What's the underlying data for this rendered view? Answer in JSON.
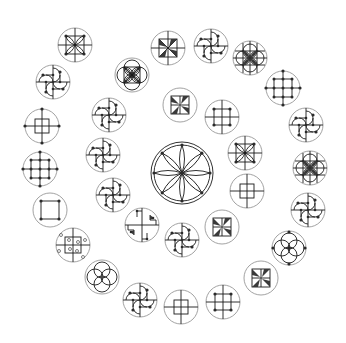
{
  "diagram": {
    "title": "",
    "background": "#ffffff",
    "colors": {
      "frame": "#8a8a8a",
      "ink": "#1a1a1a"
    },
    "center_motif": {
      "cx": 182,
      "cy": 173,
      "r": 31,
      "type": "eight-petal-rosette"
    },
    "motifs": [
      {
        "id": "m1",
        "cx": 75,
        "cy": 45,
        "r": 17,
        "type": "flower-square-cross"
      },
      {
        "id": "m2",
        "cx": 168,
        "cy": 48,
        "r": 17,
        "type": "pinwheel-square-cross"
      },
      {
        "id": "m3",
        "cx": 211,
        "cy": 46,
        "r": 17,
        "type": "arc-pinwheel"
      },
      {
        "id": "m4",
        "cx": 250,
        "cy": 58,
        "r": 17,
        "type": "flower-grid"
      },
      {
        "id": "m5",
        "cx": 132,
        "cy": 75,
        "r": 17,
        "type": "four-circle-square"
      },
      {
        "id": "m6",
        "cx": 53,
        "cy": 82,
        "r": 17,
        "type": "arc-pinwheel"
      },
      {
        "id": "m7",
        "cx": 283,
        "cy": 88,
        "r": 17,
        "type": "dot-grid-3x3"
      },
      {
        "id": "m8",
        "cx": 180,
        "cy": 105,
        "r": 17,
        "type": "small-pinwheel-square"
      },
      {
        "id": "m9",
        "cx": 109,
        "cy": 115,
        "r": 17,
        "type": "arc-pinwheel"
      },
      {
        "id": "m10",
        "cx": 222,
        "cy": 117,
        "r": 17,
        "type": "dot-square-cross"
      },
      {
        "id": "m11",
        "cx": 306,
        "cy": 125,
        "r": 17,
        "type": "arc-pinwheel"
      },
      {
        "id": "m12",
        "cx": 42,
        "cy": 126,
        "r": 17,
        "type": "square-cross-dots"
      },
      {
        "id": "m13",
        "cx": 245,
        "cy": 153,
        "r": 17,
        "type": "flower-square-cross"
      },
      {
        "id": "m14",
        "cx": 103,
        "cy": 155,
        "r": 17,
        "type": "arc-pinwheel"
      },
      {
        "id": "m15",
        "cx": 310,
        "cy": 168,
        "r": 17,
        "type": "flower-grid"
      },
      {
        "id": "m16",
        "cx": 40,
        "cy": 169,
        "r": 17,
        "type": "dot-grid-3x3"
      },
      {
        "id": "m17",
        "cx": 247,
        "cy": 191,
        "r": 17,
        "type": "square-cross"
      },
      {
        "id": "m18",
        "cx": 113,
        "cy": 195,
        "r": 17,
        "type": "arc-pinwheel"
      },
      {
        "id": "m19",
        "cx": 308,
        "cy": 210,
        "r": 17,
        "type": "arc-pinwheel"
      },
      {
        "id": "m20",
        "cx": 50,
        "cy": 210,
        "r": 17,
        "type": "square-corner-dots"
      },
      {
        "id": "m21",
        "cx": 142,
        "cy": 225,
        "r": 17,
        "type": "step-pinwheel"
      },
      {
        "id": "m22",
        "cx": 222,
        "cy": 227,
        "r": 17,
        "type": "small-pinwheel-square"
      },
      {
        "id": "m23",
        "cx": 182,
        "cy": 240,
        "r": 17,
        "type": "arc-pinwheel"
      },
      {
        "id": "m24",
        "cx": 73,
        "cy": 245,
        "r": 17,
        "type": "square-open-circles"
      },
      {
        "id": "m25",
        "cx": 289,
        "cy": 248,
        "r": 17,
        "type": "four-circle-dots"
      },
      {
        "id": "m26",
        "cx": 102,
        "cy": 277,
        "r": 17,
        "type": "four-circle"
      },
      {
        "id": "m27",
        "cx": 261,
        "cy": 278,
        "r": 17,
        "type": "small-pinwheel-square"
      },
      {
        "id": "m28",
        "cx": 140,
        "cy": 300,
        "r": 17,
        "type": "arc-pinwheel"
      },
      {
        "id": "m29",
        "cx": 223,
        "cy": 302,
        "r": 17,
        "type": "dot-square-cross"
      },
      {
        "id": "m30",
        "cx": 181,
        "cy": 307,
        "r": 17,
        "type": "square-cross"
      }
    ]
  }
}
